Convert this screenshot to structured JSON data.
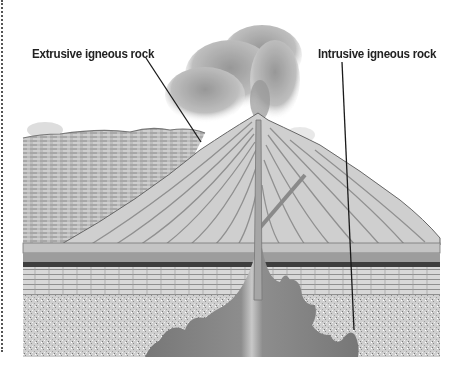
{
  "figure": {
    "labels": [
      {
        "id": "extrusive",
        "text": "Extrusive igneous rock"
      },
      {
        "id": "intrusive",
        "text": "Intrusive igneous rock"
      }
    ]
  },
  "colors": {
    "background": "#ffffff",
    "label_text": "#222222",
    "leader_line": "#1a1a1a",
    "magma": "#8a8a8a",
    "rock_light": "#d9d9d9",
    "rock_mid": "#b5b5b5",
    "rock_dark": "#555555",
    "ash_cloud": "#9a9a9a"
  }
}
